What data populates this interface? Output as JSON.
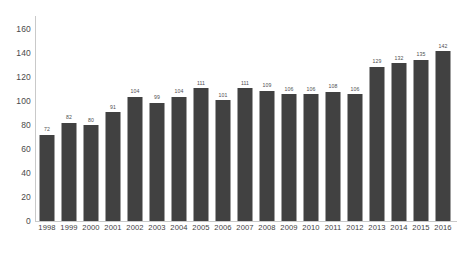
{
  "chart_data": {
    "type": "bar",
    "title": "",
    "subtitle": "",
    "xlabel": "",
    "ylabel": "",
    "categories": [
      "1998",
      "1999",
      "2000",
      "2001",
      "2002",
      "2003",
      "2004",
      "2005",
      "2006",
      "2007",
      "2008",
      "2009",
      "2010",
      "2011",
      "2012",
      "2013",
      "2014",
      "2015",
      "2016"
    ],
    "values": [
      72,
      82,
      80,
      91,
      104,
      99,
      104,
      111,
      101,
      111,
      109,
      106,
      106,
      108,
      106,
      129,
      132,
      135,
      142
    ],
    "ylim": [
      0,
      170
    ],
    "yticks": [
      0,
      20,
      40,
      60,
      80,
      100,
      120,
      140,
      160
    ],
    "ytick_labels": [
      "0",
      "20",
      "40",
      "60",
      "80",
      "100",
      "120",
      "140",
      "160"
    ],
    "grid": false,
    "legend": null,
    "legend_position": "none",
    "data_labels_shown": true,
    "bar_color": "#414141",
    "axis_color": "#c9c9c9",
    "label_color": "#4f4f4f",
    "tick_color": "#4a4a4a",
    "background_color": "#ffffff"
  }
}
